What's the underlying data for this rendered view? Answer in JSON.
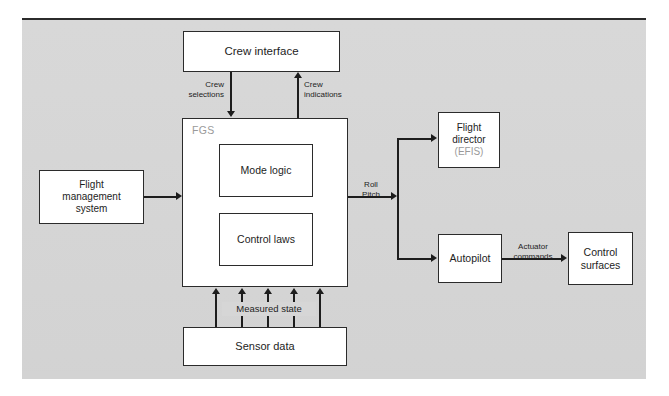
{
  "diagram": {
    "background_color": "#d6d6d6",
    "node_fill": "#ffffff",
    "line_color": "#1d1d1d",
    "muted_color": "#9a9a9a"
  },
  "nodes": {
    "crew_interface": {
      "label": "Crew interface"
    },
    "fgs": {
      "label": "FGS"
    },
    "mode_logic": {
      "label": "Mode logic"
    },
    "control_laws": {
      "label": "Control laws"
    },
    "flight_management_system": {
      "line1": "Flight",
      "line2": "management",
      "line3": "system"
    },
    "flight_director": {
      "line1": "Flight",
      "line2": "director",
      "sub": "(EFIS)"
    },
    "autopilot": {
      "label": "Autopilot"
    },
    "control_surfaces": {
      "line1": "Control",
      "line2": "surfaces"
    },
    "sensor_data": {
      "label": "Sensor data"
    }
  },
  "edge_labels": {
    "crew_selections": {
      "line1": "Crew",
      "line2": "selections"
    },
    "crew_indications": {
      "line1": "Crew",
      "line2": "indications"
    },
    "roll_pitch": {
      "line1": "Roll",
      "line2": "Pitch"
    },
    "actuator_commands": {
      "line1": "Actuator",
      "line2": "commands"
    },
    "measured_state": {
      "label": "Measured state"
    }
  }
}
